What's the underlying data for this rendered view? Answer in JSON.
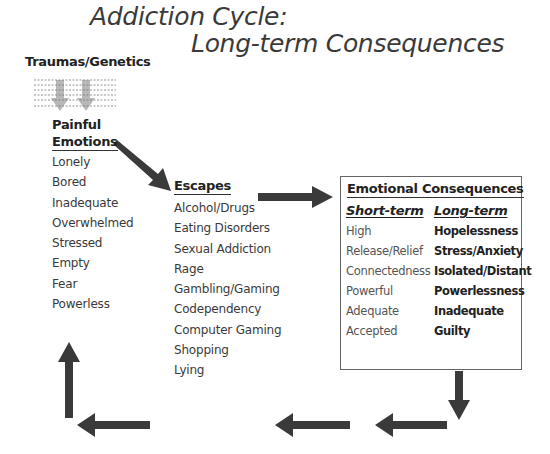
{
  "title": {
    "line1": "Addiction Cycle:",
    "line2": "Long-term Consequences"
  },
  "source": {
    "label": "Traumas/Genetics"
  },
  "painful_emotions": {
    "heading_line1": "Painful",
    "heading_line2": "Emotions",
    "items": [
      "Lonely",
      "Bored",
      "Inadequate",
      "Overwhelmed",
      "Stressed",
      "Empty",
      "Fear",
      "Powerless"
    ]
  },
  "escapes": {
    "heading": "Escapes",
    "items": [
      "Alcohol/Drugs",
      "Eating Disorders",
      "Sexual Addiction",
      "Rage",
      "Gambling/Gaming",
      "Codependency",
      "Computer Gaming",
      "Shopping",
      "Lying"
    ]
  },
  "emotional_consequences": {
    "heading": "Emotional Consequences",
    "short_term": {
      "heading": "Short-term",
      "items": [
        "High",
        "Release/Relief",
        "Connectedness",
        "Powerful",
        "Adequate",
        "Accepted"
      ]
    },
    "long_term": {
      "heading": "Long-term",
      "items": [
        "Hopelessness",
        "Stress/Anxiety",
        "Isolated/Distant",
        "Powerlessness",
        "Inadequate",
        "Guilty"
      ]
    }
  },
  "colors": {
    "arrow": "#3a3a3a",
    "source_arrow": "#b0b0b0",
    "box_border": "#666666"
  }
}
